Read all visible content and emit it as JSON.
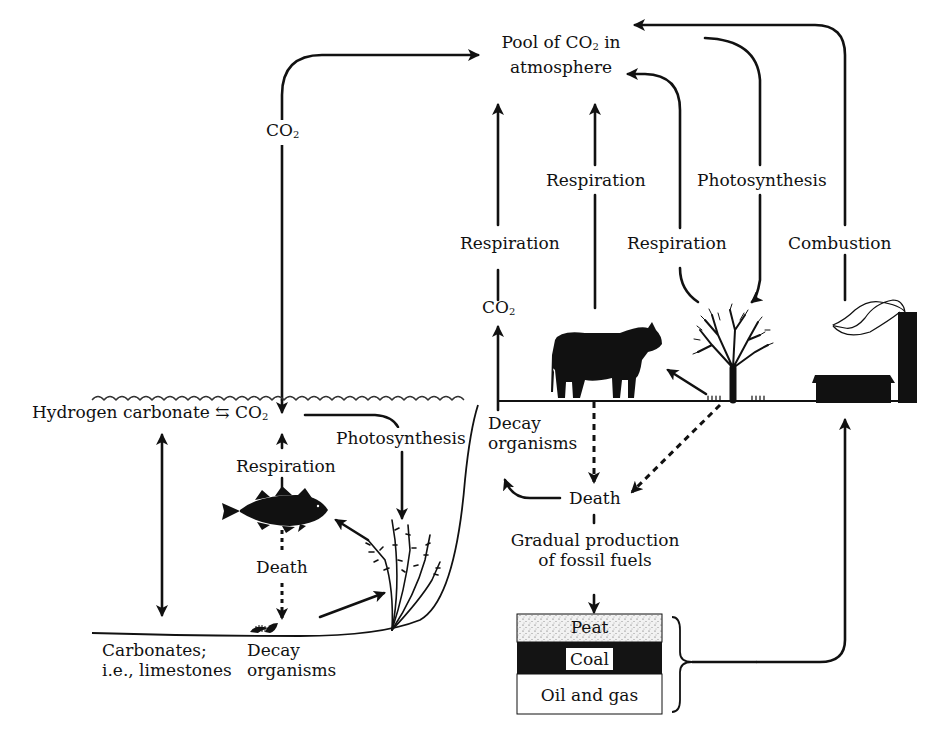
{
  "diagram": {
    "title_node": {
      "line1_pre": "Pool of CO",
      "line1_sub": "2",
      "line1_post": " in",
      "line2": "atmosphere"
    },
    "labels": {
      "co2_left_vertical": {
        "pre": "CO",
        "sub": "2"
      },
      "respiration_decay": "Respiration",
      "respiration_cow": "Respiration",
      "photosynthesis_tree": "Photosynthesis",
      "respiration_tree": "Respiration",
      "combustion": "Combustion",
      "co2_decay": {
        "pre": "CO",
        "sub": "2"
      },
      "hydrogen_carbonate": "Hydrogen carbonate",
      "equilibrium_symbol": "⇆",
      "co2_water": {
        "pre": "CO",
        "sub": "2"
      },
      "photosynthesis_water": "Photosynthesis",
      "respiration_fish": "Respiration",
      "death_fish": "Death",
      "decay_organisms_land_1": "Decay",
      "decay_organisms_land_2": "organisms",
      "death_land": "Death",
      "fossil_1": "Gradual production",
      "fossil_2": "of fossil fuels",
      "carbonates_1": "Carbonates;",
      "carbonates_2": "i.e., limestones",
      "decay_organisms_sea_1": "Decay",
      "decay_organisms_sea_2": "organisms"
    },
    "fossil_layers": [
      {
        "name": "Peat",
        "fill": "#e6e6e6"
      },
      {
        "name": "Coal",
        "fill": "#141414"
      },
      {
        "name": "Oil and gas",
        "fill": "#ffffff"
      }
    ],
    "illustrations": [
      "cow",
      "tree",
      "factory",
      "fish",
      "seaweed",
      "decaying-organism",
      "water-surface-waves"
    ],
    "colors": {
      "ink": "#111111",
      "background": "#ffffff"
    }
  }
}
